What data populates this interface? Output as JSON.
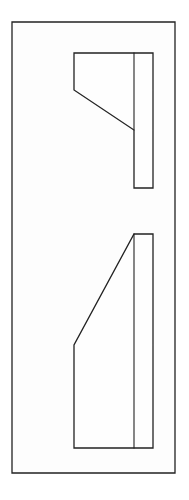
{
  "document": {
    "title": "Technical Line Drawing",
    "kind": "line-drawing",
    "description": "Monochrome black-on-white outline drawing: two stepped bracket profiles inside a tall rectangular border frame",
    "canvas": {
      "width": 189,
      "height": 500,
      "background_color": "#ffffff",
      "interior_fill": "#fdfdfd"
    },
    "stroke": {
      "color": "#222222",
      "frame_width": 1.3,
      "shape_width": 1.3,
      "divider_width": 1.1
    },
    "frame": {
      "name": "outer-border-frame",
      "x": 12,
      "y": 22,
      "width": 163,
      "height": 451,
      "points": "12,22 175,22 175,473 12,473"
    },
    "shapes": [
      {
        "name": "upper-bracket-profile",
        "label": "Upper stepped bracket, diagonal descends left-to-right",
        "outline": "74,53 153,53 153,188 134,188 134,130 74,90",
        "vertices": [
          {
            "x": 74,
            "y": 53
          },
          {
            "x": 153,
            "y": 53
          },
          {
            "x": 153,
            "y": 188
          },
          {
            "x": 134,
            "y": 188
          },
          {
            "x": 134,
            "y": 130
          },
          {
            "x": 74,
            "y": 90
          }
        ],
        "divider": {
          "name": "upper-vertical-divider",
          "line": "134,53 134,130",
          "x1": 134,
          "y1": 53,
          "x2": 134,
          "y2": 130
        }
      },
      {
        "name": "lower-bracket-profile",
        "label": "Lower stepped bracket, diagonal ascends left-to-right",
        "outline": "134,234 153,234 153,448 74,448 74,345",
        "vertices": [
          {
            "x": 134,
            "y": 234
          },
          {
            "x": 153,
            "y": 234
          },
          {
            "x": 153,
            "y": 448
          },
          {
            "x": 74,
            "y": 448
          },
          {
            "x": 74,
            "y": 345
          }
        ],
        "divider": {
          "name": "lower-vertical-divider",
          "line": "134,234 134,448",
          "x1": 134,
          "y1": 234,
          "x2": 134,
          "y2": 448
        }
      }
    ]
  }
}
